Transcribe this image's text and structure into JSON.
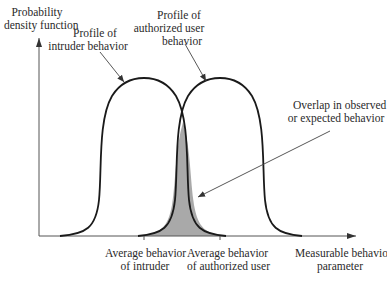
{
  "diagram": {
    "y_axis_label": [
      "Probability",
      "density function"
    ],
    "x_axis_label": [
      "Measurable behavior",
      "parameter"
    ],
    "curves": [
      {
        "name": "intruder",
        "label": [
          "Profile of",
          "intruder behavior"
        ]
      },
      {
        "name": "authorized-user",
        "label": [
          "Profile of",
          "authorized user",
          "behavior"
        ]
      }
    ],
    "overlap_label": [
      "Overlap in observed",
      "or expected behavior"
    ],
    "ticks": [
      {
        "name": "avg-intruder",
        "label": [
          "Average behavior",
          "of intruder"
        ]
      },
      {
        "name": "avg-authorized",
        "label": [
          "Average behavior",
          "of authorized user"
        ]
      }
    ],
    "colors": {
      "curve": "#1a1a1a",
      "axis": "#555555",
      "overlap_fill": "#a9a9a9",
      "arrow": "#444444"
    }
  }
}
